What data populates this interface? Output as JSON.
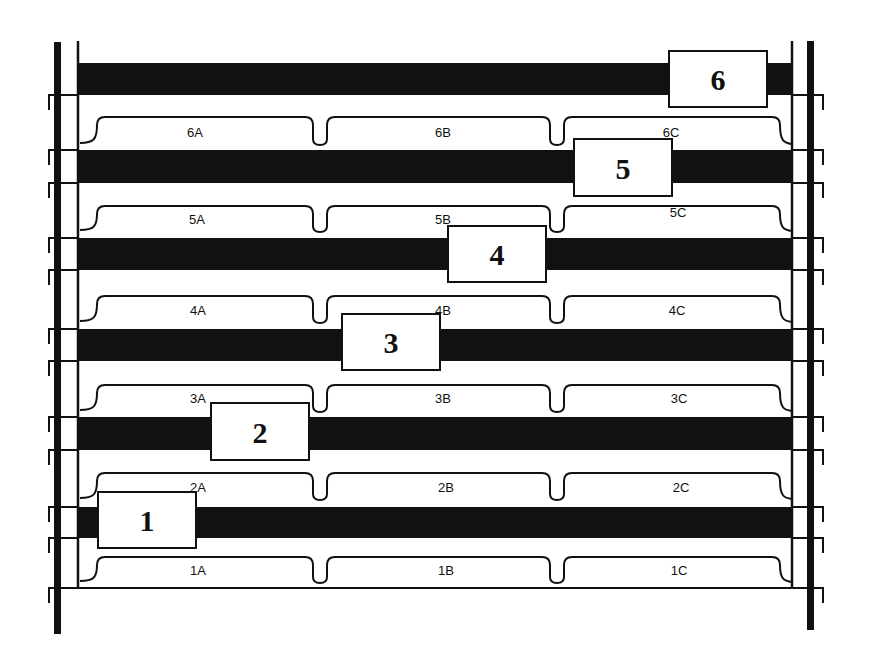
{
  "diagram": {
    "colors": {
      "ink": "#111111",
      "background": "#ffffff",
      "box_fill": "#ffffff"
    },
    "frame": {
      "left_post": {
        "x": 54,
        "width": 7,
        "y_top": 42,
        "y_bottom": 634
      },
      "right_post": {
        "x": 807,
        "width": 7,
        "y_top": 41,
        "y_bottom": 630
      },
      "left_inner_line_x": 78,
      "right_inner_line_x": 792,
      "inner_line_top": 41,
      "bottom_line_y": 588,
      "left_hooks_y": [
        95,
        150,
        183,
        238,
        270,
        329,
        361,
        417,
        450,
        507,
        538,
        588
      ],
      "right_hooks_y": [
        95,
        150,
        183,
        238,
        270,
        329,
        361,
        417,
        450,
        507,
        538,
        588
      ]
    },
    "levels": [
      {
        "id": "6",
        "bar": {
          "y": 63,
          "height": 32
        },
        "box": {
          "label": "6",
          "x": 669,
          "y": 51,
          "w": 98,
          "h": 56
        },
        "bracket_top": 117,
        "bracket_bottom": 145,
        "slots": [
          {
            "label": "6A",
            "x": 195,
            "y": 137
          },
          {
            "label": "6B",
            "x": 443,
            "y": 137
          },
          {
            "label": "6C",
            "x": 671,
            "y": 137
          }
        ]
      },
      {
        "id": "5",
        "bar": {
          "y": 150,
          "height": 33
        },
        "box": {
          "label": "5",
          "x": 574,
          "y": 139,
          "w": 98,
          "h": 57
        },
        "bracket_top": 206,
        "bracket_bottom": 232,
        "slots": [
          {
            "label": "5A",
            "x": 197,
            "y": 224
          },
          {
            "label": "5B",
            "x": 443,
            "y": 224
          },
          {
            "label": "5C",
            "x": 678,
            "y": 217
          }
        ]
      },
      {
        "id": "4",
        "bar": {
          "y": 238,
          "height": 32
        },
        "box": {
          "label": "4",
          "x": 448,
          "y": 226,
          "w": 98,
          "h": 56
        },
        "bracket_top": 296,
        "bracket_bottom": 323,
        "slots": [
          {
            "label": "4A",
            "x": 198,
            "y": 315
          },
          {
            "label": "4B",
            "x": 443,
            "y": 315
          },
          {
            "label": "4C",
            "x": 677,
            "y": 315
          }
        ]
      },
      {
        "id": "3",
        "bar": {
          "y": 329,
          "height": 32
        },
        "box": {
          "label": "3",
          "x": 342,
          "y": 314,
          "w": 98,
          "h": 56
        },
        "bracket_top": 385,
        "bracket_bottom": 412,
        "slots": [
          {
            "label": "3A",
            "x": 198,
            "y": 403
          },
          {
            "label": "3B",
            "x": 443,
            "y": 403
          },
          {
            "label": "3C",
            "x": 679,
            "y": 403
          }
        ]
      },
      {
        "id": "2",
        "bar": {
          "y": 417,
          "height": 33
        },
        "box": {
          "label": "2",
          "x": 211,
          "y": 403,
          "w": 98,
          "h": 57
        },
        "bracket_top": 473,
        "bracket_bottom": 500,
        "slots": [
          {
            "label": "2A",
            "x": 198,
            "y": 492
          },
          {
            "label": "2B",
            "x": 446,
            "y": 492
          },
          {
            "label": "2C",
            "x": 681,
            "y": 492
          }
        ]
      },
      {
        "id": "1",
        "bar": {
          "y": 507,
          "height": 31
        },
        "box": {
          "label": "1",
          "x": 98,
          "y": 492,
          "w": 98,
          "h": 56
        },
        "bracket_top": 557,
        "bracket_bottom": 583,
        "slots": [
          {
            "label": "1A",
            "x": 198,
            "y": 575
          },
          {
            "label": "1B",
            "x": 446,
            "y": 575
          },
          {
            "label": "1C",
            "x": 679,
            "y": 575
          }
        ]
      }
    ],
    "slot_dividers_x": [
      320,
      557
    ],
    "bracket_x_left": 80,
    "bracket_x_right": 792
  }
}
